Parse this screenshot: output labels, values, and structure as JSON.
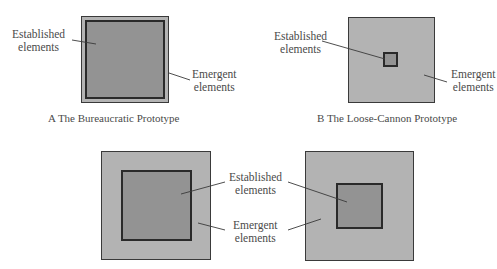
{
  "colors": {
    "emergent_fill": "#b3b3b3",
    "established_fill": "#939393",
    "border": "#2a2a2a",
    "text": "#4a4a4a"
  },
  "panels": [
    {
      "id": "A",
      "caption": "A  The Bureaucratic Prototype",
      "established_label": [
        "Established",
        "elements"
      ],
      "emergent_label": [
        "Emergent",
        "elements"
      ]
    },
    {
      "id": "B",
      "caption": "B  The Loose-Cannon Prototype",
      "established_label": [
        "Established",
        "elements"
      ],
      "emergent_label": [
        "Emergent",
        "elements"
      ]
    },
    {
      "id": "C",
      "caption": "",
      "established_label": [
        "Established",
        "elements"
      ],
      "emergent_label": [
        "Emergent",
        "elements"
      ]
    },
    {
      "id": "D",
      "caption": "",
      "established_label": [
        "Established",
        "elements"
      ],
      "emergent_label": [
        "Emergent",
        "elements"
      ]
    }
  ]
}
